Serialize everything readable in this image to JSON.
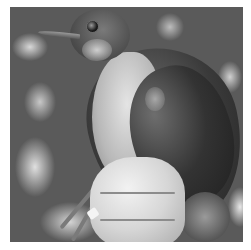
{
  "image": {
    "description": "Grayscale photograph of a bird with a white throat and dark wings, held in a human hand against blurred foliage; leg band visible on one leg",
    "palette": {
      "background": "#5a5a5a",
      "border": "#ffffff",
      "hand": "#d6d6d6",
      "wing": "#2a2a2a",
      "breast": "#d0d0d0"
    }
  }
}
